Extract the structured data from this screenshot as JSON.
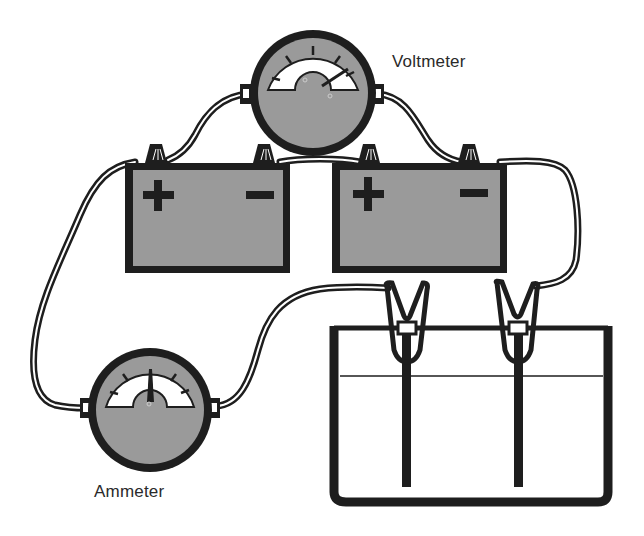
{
  "diagram": {
    "type": "electrical-circuit",
    "labels": {
      "voltmeter": "Voltmeter",
      "ammeter": "Ammeter"
    },
    "components": [
      {
        "id": "voltmeter",
        "kind": "meter",
        "label": "Voltmeter"
      },
      {
        "id": "ammeter",
        "kind": "meter",
        "label": "Ammeter"
      },
      {
        "id": "battery-left",
        "kind": "battery",
        "terminals": [
          "+",
          "−"
        ]
      },
      {
        "id": "battery-right",
        "kind": "battery",
        "terminals": [
          "+",
          "−"
        ]
      },
      {
        "id": "electrolytic-cell",
        "kind": "beaker",
        "electrodes": 2
      }
    ],
    "battery_left": {
      "plus": "+",
      "minus": "−"
    },
    "battery_right": {
      "plus": "+",
      "minus": "−"
    },
    "colors": {
      "ink": "#1e1e1e",
      "fill_gray": "#9a9a9a",
      "background": "#ffffff"
    }
  }
}
